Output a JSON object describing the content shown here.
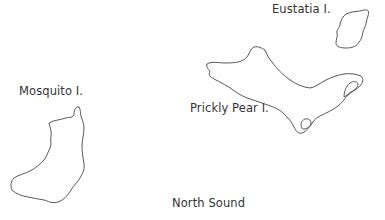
{
  "map": {
    "labels": {
      "eustatia": "Eustatia I.",
      "mosquito": "Mosquito I.",
      "prickly_pear": "Prickly Pear I.",
      "north_sound": "North Sound"
    },
    "colors": {
      "background": "#ffffff",
      "outline": "#444444",
      "text": "#333333"
    }
  }
}
